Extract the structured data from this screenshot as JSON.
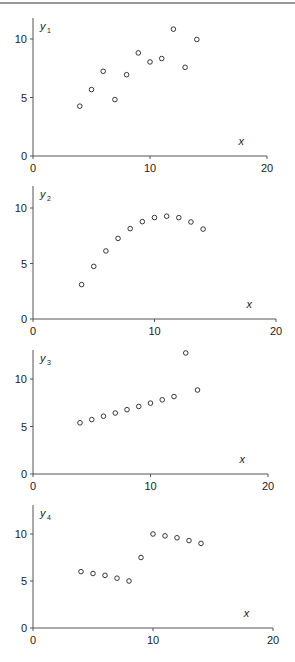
{
  "chart_data": [
    {
      "type": "scatter",
      "title": "",
      "xlabel": "x",
      "ylabel": "y1",
      "ylabel_main": "y",
      "ylabel_sub": "1",
      "xlim": [
        0,
        20
      ],
      "ylim": [
        0,
        12
      ],
      "xticks": [
        "0",
        "10",
        "20"
      ],
      "yticks": [
        "0",
        "5",
        "10"
      ],
      "grid": false,
      "x": [
        4,
        5,
        6,
        7,
        8,
        9,
        10,
        11,
        12,
        13,
        14
      ],
      "y": [
        4.26,
        5.68,
        7.24,
        4.82,
        6.95,
        8.81,
        8.04,
        8.33,
        10.84,
        7.58,
        9.96
      ],
      "layout": {
        "top": 18,
        "y0": 156,
        "y10": 39,
        "x0": 33,
        "x20": 267
      }
    },
    {
      "type": "scatter",
      "title": "",
      "xlabel": "x",
      "ylabel": "y2",
      "ylabel_main": "y",
      "ylabel_sub": "2",
      "xlim": [
        0,
        20
      ],
      "ylim": [
        0,
        12
      ],
      "xticks": [
        "0",
        "10",
        "20"
      ],
      "yticks": [
        "0",
        "5",
        "10"
      ],
      "grid": false,
      "x": [
        4,
        5,
        6,
        7,
        8,
        9,
        10,
        11,
        12,
        13,
        14
      ],
      "y": [
        3.1,
        4.74,
        6.13,
        7.26,
        8.14,
        8.77,
        9.14,
        9.26,
        9.13,
        8.74,
        8.1
      ],
      "layout": {
        "top": 186,
        "y0": 319,
        "y10": 208,
        "x0": 33,
        "x20": 276
      }
    },
    {
      "type": "scatter",
      "title": "",
      "xlabel": "x",
      "ylabel": "y3",
      "ylabel_main": "y",
      "ylabel_sub": "3",
      "xlim": [
        0,
        20
      ],
      "ylim": [
        0,
        13
      ],
      "xticks": [
        "0",
        "10",
        "20"
      ],
      "yticks": [
        "0",
        "5",
        "10"
      ],
      "grid": false,
      "x": [
        4,
        5,
        6,
        7,
        8,
        9,
        10,
        11,
        12,
        13,
        14
      ],
      "y": [
        5.39,
        5.73,
        6.08,
        6.42,
        6.77,
        7.11,
        7.46,
        7.81,
        8.15,
        12.74,
        8.84
      ],
      "layout": {
        "top": 350,
        "y0": 474,
        "y10": 379,
        "x0": 33,
        "x20": 268
      }
    },
    {
      "type": "scatter",
      "title": "",
      "xlabel": "x",
      "ylabel": "y4",
      "ylabel_main": "y",
      "ylabel_sub": "4",
      "xlim": [
        0,
        20
      ],
      "ylim": [
        0,
        13
      ],
      "xticks": [
        "0",
        "10",
        "20"
      ],
      "yticks": [
        "0",
        "5",
        "10"
      ],
      "grid": false,
      "x": [
        4,
        5,
        6,
        7,
        8,
        9,
        10,
        11,
        12,
        13,
        14
      ],
      "y": [
        6.0,
        5.8,
        5.6,
        5.3,
        5.0,
        7.5,
        10.0,
        9.8,
        9.6,
        9.3,
        9.0
      ],
      "layout": {
        "top": 505,
        "y0": 628,
        "y10": 534,
        "x0": 33,
        "x20": 273
      }
    }
  ]
}
